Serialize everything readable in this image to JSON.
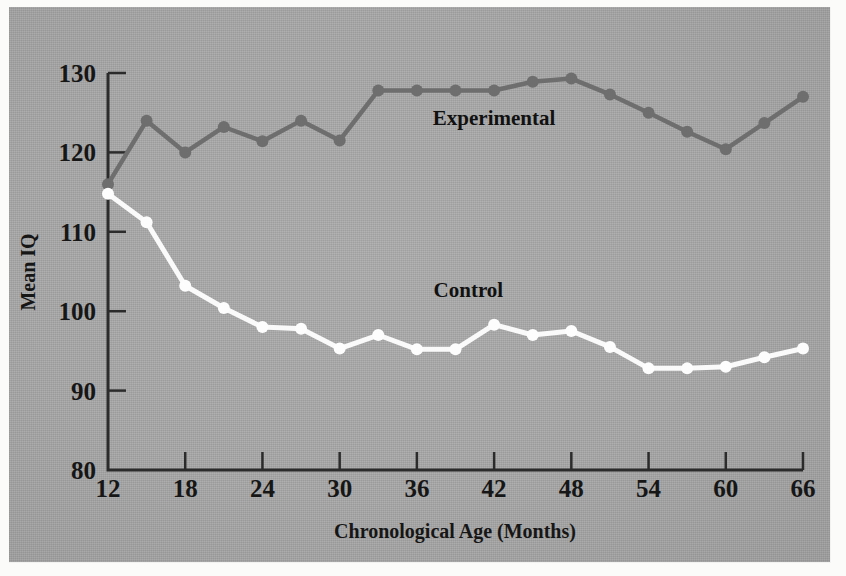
{
  "figure": {
    "background_color": "#a8a8a8",
    "page_color": "#fbfbf9"
  },
  "chart_data": {
    "type": "line",
    "title": "",
    "xlabel": "Chronological Age (Months)",
    "ylabel": "Mean IQ",
    "xlim": [
      12,
      66
    ],
    "ylim": [
      80,
      130
    ],
    "xticks": [
      12,
      18,
      24,
      30,
      36,
      42,
      48,
      54,
      60,
      66
    ],
    "xtick_labels": [
      "12",
      "18",
      "24",
      "30",
      "36",
      "42",
      "48",
      "54",
      "60",
      "66"
    ],
    "yticks": [
      80,
      90,
      100,
      110,
      120,
      130
    ],
    "ytick_labels": [
      "80",
      "90",
      "100",
      "110",
      "120",
      "130"
    ],
    "grid": false,
    "legend_position": "inline-annotation",
    "x": [
      12,
      15,
      18,
      21,
      24,
      27,
      30,
      33,
      36,
      39,
      42,
      45,
      48,
      51,
      54,
      57,
      60,
      63,
      66
    ],
    "series": [
      {
        "name": "Experimental",
        "color": "#6e6e6e",
        "marker": "circle",
        "label_x": 42,
        "label_y": 123.5,
        "values": [
          116,
          124,
          120,
          123.2,
          121.4,
          124,
          121.5,
          127.8,
          127.8,
          127.8,
          127.8,
          128.9,
          129.3,
          127.3,
          125,
          122.6,
          120.4,
          123.7,
          127
        ]
      },
      {
        "name": "Control",
        "color": "#fafafa",
        "marker": "circle",
        "label_x": 40,
        "label_y": 101.8,
        "values": [
          114.8,
          111.2,
          103.2,
          100.4,
          98,
          97.8,
          95.3,
          97,
          95.2,
          95.2,
          98.3,
          97,
          97.5,
          95.5,
          92.8,
          92.8,
          93,
          94.2,
          95.3
        ]
      }
    ],
    "annotations": [
      {
        "text": "Experimental",
        "x": 42,
        "y": 123.5
      },
      {
        "text": "Control",
        "x": 40,
        "y": 101.8
      }
    ]
  }
}
